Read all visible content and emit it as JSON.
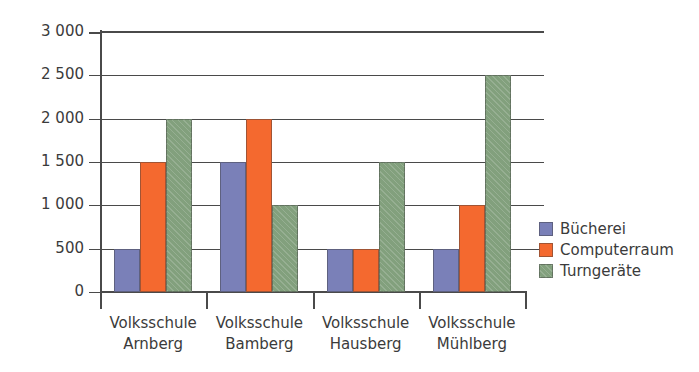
{
  "chart_data": {
    "type": "bar",
    "title": "",
    "subtitle": "",
    "xlabel": "",
    "ylabel": "",
    "ylim": [
      0,
      3000
    ],
    "ytick_values": [
      0,
      500,
      1000,
      1500,
      2000,
      2500,
      3000
    ],
    "ytick_labels": [
      "0",
      "500",
      "1 000",
      "1 500",
      "2 000",
      "2 500",
      "3 000"
    ],
    "grid": true,
    "grid_axis": "y",
    "legend_position": "right",
    "categories": [
      "Volksschule Arnberg",
      "Volksschule Bamberg",
      "Volksschule Hausberg",
      "Volksschule Mühlberg"
    ],
    "category_lines": [
      [
        "Volksschule",
        "Arnberg"
      ],
      [
        "Volksschule",
        "Bamberg"
      ],
      [
        "Volksschule",
        "Hausberg"
      ],
      [
        "Volksschule",
        "Mühlberg"
      ]
    ],
    "series": [
      {
        "name": "Bücherei",
        "color": "#7a80b8",
        "values": [
          500,
          1500,
          500,
          500
        ]
      },
      {
        "name": "Computerraum",
        "color": "#f4692f",
        "values": [
          1500,
          2000,
          500,
          1000
        ]
      },
      {
        "name": "Turngeräte",
        "color": "#82a07d",
        "values": [
          2000,
          1000,
          1500,
          2500
        ]
      }
    ]
  },
  "legend": {
    "items": [
      {
        "label": "Bücherei"
      },
      {
        "label": "Computerraum"
      },
      {
        "label": "Turngeräte"
      }
    ]
  }
}
